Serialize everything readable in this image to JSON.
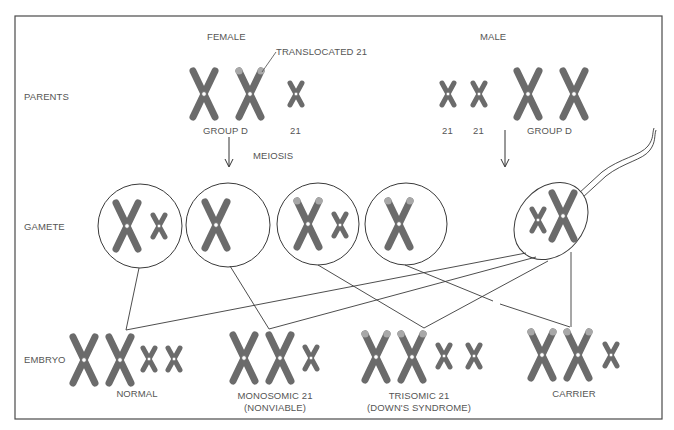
{
  "diagram": {
    "row_labels": {
      "parents": "PARENTS",
      "gamete": "GAMETE",
      "embryo": "EMBRYO"
    },
    "parents": {
      "female": {
        "label": "FEMALE",
        "group_label": "GROUP D",
        "chr21_label": "21",
        "translocation_callout": "TRANSLOCATED 21"
      },
      "male": {
        "label": "MALE",
        "chr21_labels": [
          "21",
          "21"
        ],
        "group_label": "GROUP D"
      }
    },
    "process_label": "MEIOSIS",
    "gametes": [
      {
        "id": "female-gamete-1",
        "contents": "group D + 21"
      },
      {
        "id": "female-gamete-2",
        "contents": "group D"
      },
      {
        "id": "female-gamete-3",
        "contents": "translocated D + 21"
      },
      {
        "id": "female-gamete-4",
        "contents": "translocated D"
      },
      {
        "id": "sperm",
        "contents": "group D + 21"
      }
    ],
    "embryos": [
      {
        "label_line1": "NORMAL",
        "label_line2": ""
      },
      {
        "label_line1": "MONOSOMIC 21",
        "label_line2": "(NONVIABLE)"
      },
      {
        "label_line1": "TRISOMIC 21",
        "label_line2": "(DOWN'S SYNDROME)"
      },
      {
        "label_line1": "CARRIER",
        "label_line2": ""
      }
    ],
    "colors": {
      "chromosome": "#6b6b6b",
      "translocation_tip": "#a8a8a8",
      "line": "#3a3a3a",
      "text": "#555555",
      "background": "#ffffff"
    }
  }
}
